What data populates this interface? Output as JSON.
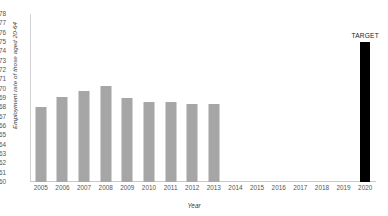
{
  "chart_data": {
    "type": "bar",
    "title": "",
    "xlabel": "Year",
    "ylabel": "Employment rate of those aged 20-64",
    "ylim": [
      60,
      78
    ],
    "ytick_step": 1,
    "yticks": [
      78,
      77,
      76,
      75,
      74,
      73,
      72,
      71,
      70,
      69,
      68,
      67,
      66,
      65,
      64,
      63,
      62,
      61,
      60
    ],
    "categories": [
      "2005",
      "2006",
      "2007",
      "2008",
      "2009",
      "2010",
      "2011",
      "2012",
      "2013",
      "2014",
      "2015",
      "2016",
      "2017",
      "2018",
      "2019",
      "2020"
    ],
    "values": [
      68.0,
      69.1,
      69.8,
      70.3,
      69.0,
      68.6,
      68.6,
      68.4,
      68.4,
      null,
      null,
      null,
      null,
      null,
      null,
      75.0
    ],
    "grid": false,
    "legend": null,
    "series": [
      {
        "name": "Employment rate",
        "values": [
          68.0,
          69.1,
          69.8,
          70.3,
          69.0,
          68.6,
          68.6,
          68.4,
          68.4,
          null,
          null,
          null,
          null,
          null,
          null,
          75.0
        ]
      }
    ],
    "annotations": [
      {
        "category": "2020",
        "text": "TARGET"
      }
    ],
    "colors": {
      "bar": "#a6a6a6",
      "target_bar": "#000000",
      "axis": "#c9c9c9",
      "text": "#555555"
    },
    "bar_styles": [
      "actual",
      "actual",
      "actual",
      "actual",
      "actual",
      "actual",
      "actual",
      "actual",
      "actual",
      "none",
      "none",
      "none",
      "none",
      "none",
      "none",
      "target"
    ]
  }
}
